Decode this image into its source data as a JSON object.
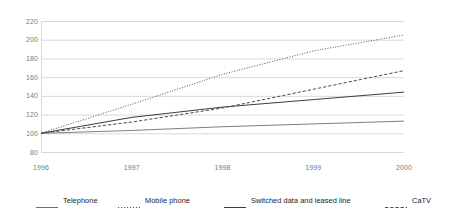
{
  "chart_data": {
    "type": "line",
    "title": "",
    "subtitle": "",
    "xlabel": "",
    "ylabel": "",
    "x": [
      1996,
      1997,
      1998,
      1999,
      2000
    ],
    "categories": [
      "1996",
      "1997",
      "1998",
      "1999",
      "2000"
    ],
    "xtick_labels": [
      "1996",
      "1997",
      "1998",
      "1999",
      "2000"
    ],
    "ytick_labels": [
      "80",
      "100",
      "120",
      "140",
      "160",
      "180",
      "200",
      "220"
    ],
    "ytick_values": [
      80,
      100,
      120,
      140,
      160,
      180,
      200,
      220
    ],
    "ylim": [
      80,
      220
    ],
    "xlim": [
      1996,
      2000
    ],
    "grid": "horizontal",
    "legend_position": "bottom",
    "background_color": "#ffffff",
    "gridline_color": "#d9d9d9",
    "tick_label_color": "#7b7b7b",
    "series": [
      {
        "name": "Telephone",
        "values": [
          100,
          103,
          107,
          110,
          113
        ],
        "style": "solid",
        "color": "#6e6e6e",
        "width": 0.9
      },
      {
        "name": "Mobile phone",
        "values": [
          100,
          131,
          163,
          188,
          205
        ],
        "style": "dotted",
        "color": "#555555",
        "width": 1.0
      },
      {
        "name": "Switched data and leased line",
        "values": [
          100,
          117,
          128,
          136,
          144
        ],
        "style": "solid",
        "color": "#3c3c3c",
        "width": 1.0
      },
      {
        "name": "CaTV",
        "values": [
          100,
          112,
          127,
          147,
          167
        ],
        "style": "dashed",
        "color": "#4a4a4a",
        "width": 1.0
      }
    ]
  },
  "legend": {
    "items": [
      {
        "label": "Telephone",
        "style": "solid",
        "color": "#6e6e6e"
      },
      {
        "label": "Mobile phone",
        "style": "dotted",
        "color": "#555555"
      },
      {
        "label": "Switched data and leased line",
        "style": "solid",
        "color": "#3c3c3c"
      },
      {
        "label": "CaTV",
        "style": "dashed",
        "color": "#4a4a4a"
      }
    ]
  }
}
